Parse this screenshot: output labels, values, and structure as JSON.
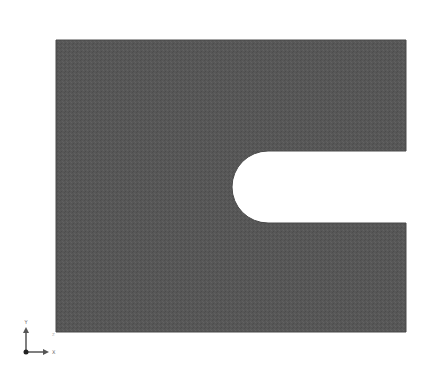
{
  "viewport": {
    "background": "#ffffff",
    "part": {
      "name": "plate-with-u-notch",
      "fill_color": "#575757",
      "edge_color": "#4a4a4a",
      "outline": {
        "left": 56,
        "top": 40,
        "right": 406,
        "bottom": 332
      },
      "notch": {
        "top": 151,
        "bottom": 223,
        "tip_x": 232,
        "open_side": "right"
      }
    },
    "triad": {
      "x_label": "X",
      "y_label": "Y",
      "z_label": "Z",
      "color": "#555555"
    }
  }
}
